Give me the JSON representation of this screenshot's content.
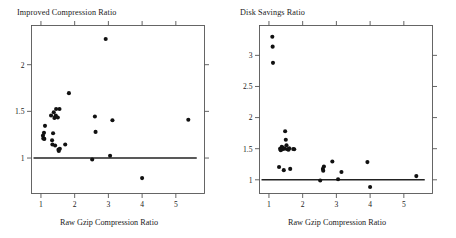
{
  "figure": {
    "panel_count": 2,
    "point_color": "#111111",
    "line_color": "#222222",
    "frame_color": "#555555",
    "background": "#ffffff"
  },
  "chart_data": [
    {
      "type": "scatter",
      "title": "Improved Compression Ratio",
      "xlabel": "Raw Gzip Compression Ratio",
      "ylabel": "",
      "xlim": [
        0.72,
        5.85
      ],
      "ylim": [
        0.62,
        2.42
      ],
      "xticks": [
        1,
        2,
        3,
        4,
        5
      ],
      "xticklabels": [
        "1",
        "2",
        "3",
        "4",
        "5"
      ],
      "yticks": [
        1,
        1.5,
        2
      ],
      "yticklabels": [
        "1",
        "1.5",
        "2"
      ],
      "grid": false,
      "legend": null,
      "reference_line": {
        "orientation": "horizontal",
        "y": 1.0,
        "x_start": 0.78,
        "x_end": 5.62
      },
      "points": [
        [
          1.06,
          1.24
        ],
        [
          1.07,
          1.21
        ],
        [
          1.09,
          1.27
        ],
        [
          1.1,
          1.205
        ],
        [
          1.12,
          1.345
        ],
        [
          1.3,
          1.455
        ],
        [
          1.33,
          1.19
        ],
        [
          1.34,
          1.145
        ],
        [
          1.36,
          1.265
        ],
        [
          1.38,
          1.49
        ],
        [
          1.4,
          1.43
        ],
        [
          1.42,
          1.135
        ],
        [
          1.44,
          1.455
        ],
        [
          1.45,
          1.525
        ],
        [
          1.5,
          1.435
        ],
        [
          1.52,
          1.09
        ],
        [
          1.53,
          1.075
        ],
        [
          1.55,
          1.525
        ],
        [
          1.56,
          1.1
        ],
        [
          1.72,
          1.145
        ],
        [
          1.83,
          1.695
        ],
        [
          2.52,
          0.985
        ],
        [
          2.6,
          1.445
        ],
        [
          2.62,
          1.28
        ],
        [
          2.92,
          2.275
        ],
        [
          3.05,
          1.025
        ],
        [
          3.12,
          1.405
        ],
        [
          4.0,
          0.785
        ],
        [
          5.37,
          1.41
        ]
      ]
    },
    {
      "type": "scatter",
      "title": "Disk Savings Ratio",
      "xlabel": "Raw Gzip Compression Ratio",
      "ylabel": "",
      "xlim": [
        0.72,
        5.85
      ],
      "ylim": [
        0.78,
        3.48
      ],
      "xticks": [
        1,
        2,
        3,
        4,
        5
      ],
      "xticklabels": [
        "1",
        "2",
        "3",
        "4",
        "5"
      ],
      "yticks": [
        1,
        1.5,
        2,
        2.5,
        3
      ],
      "yticklabels": [
        "1",
        "1.5",
        "2",
        "2.5",
        "3"
      ],
      "grid": false,
      "legend": null,
      "reference_line": {
        "orientation": "horizontal",
        "y": 1.0,
        "x_start": 0.78,
        "x_end": 5.62
      },
      "points": [
        [
          1.1,
          3.3
        ],
        [
          1.11,
          3.14
        ],
        [
          1.12,
          2.88
        ],
        [
          1.3,
          1.205
        ],
        [
          1.33,
          1.5
        ],
        [
          1.35,
          1.475
        ],
        [
          1.38,
          1.53
        ],
        [
          1.4,
          1.49
        ],
        [
          1.42,
          1.515
        ],
        [
          1.44,
          1.155
        ],
        [
          1.47,
          1.5
        ],
        [
          1.48,
          1.78
        ],
        [
          1.5,
          1.645
        ],
        [
          1.52,
          1.555
        ],
        [
          1.55,
          1.49
        ],
        [
          1.58,
          1.485
        ],
        [
          1.6,
          1.505
        ],
        [
          1.63,
          1.175
        ],
        [
          1.72,
          1.495
        ],
        [
          1.75,
          1.49
        ],
        [
          2.52,
          0.99
        ],
        [
          2.6,
          1.175
        ],
        [
          2.61,
          1.145
        ],
        [
          2.63,
          1.215
        ],
        [
          2.88,
          1.295
        ],
        [
          3.05,
          1.01
        ],
        [
          3.15,
          1.125
        ],
        [
          3.92,
          1.285
        ],
        [
          4.0,
          0.885
        ],
        [
          5.37,
          1.06
        ]
      ]
    }
  ]
}
